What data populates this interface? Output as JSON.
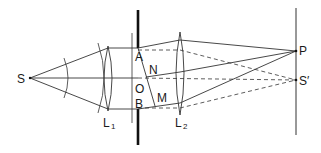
{
  "diagram": {
    "type": "optics-double-slit-lens-setup",
    "labels": {
      "source": "S",
      "lens1": "L",
      "lens1_sub": "1",
      "lens2": "L",
      "lens2_sub": "2",
      "slit_top": "A",
      "slit_bottom": "B",
      "center": "O",
      "n_point": "N",
      "m_point": "M",
      "screen_point": "P",
      "image_point": "S′"
    },
    "colors": {
      "line": "#333333",
      "screen_bar": "#111111",
      "background": "#ffffff"
    },
    "line_styles": {
      "rays_to_P": "solid",
      "rays_to_S_prime": "dashed"
    }
  }
}
